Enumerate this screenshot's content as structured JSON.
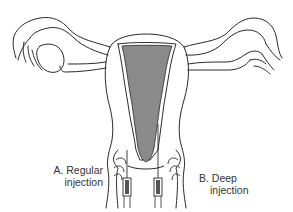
{
  "diagram": {
    "title": "",
    "type": "anatomical illustration",
    "colors": {
      "outline": "#2a2a2a",
      "cavity_fill": "#8a8a8a",
      "background": "#ffffff",
      "syringe_fill": "#555555"
    },
    "labels": {
      "a": {
        "line1": "A. Regular",
        "line2": "injection"
      },
      "b": {
        "line1": "B. Deep",
        "line2": "injection"
      }
    },
    "parts": [
      "uterus",
      "uterine cavity",
      "left fallopian tube",
      "right fallopian tube",
      "left ovary/fimbriae",
      "right ovary/fimbriae",
      "cervix",
      "vaginal walls",
      "syringe A",
      "syringe B"
    ]
  }
}
